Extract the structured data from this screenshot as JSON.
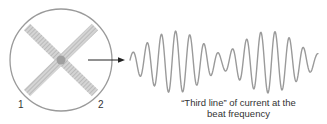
{
  "diagram": {
    "circle": {
      "label_left": "1",
      "label_right": "2",
      "stroke": "#9a9a9a",
      "beam_color": "#b8b8b8"
    },
    "arrow": {
      "color": "#222222"
    },
    "waveform": {
      "stroke": "#9a9a9a",
      "packets": 2
    },
    "caption": {
      "line1": "“Third line” of current at the",
      "line2": "beat frequency"
    }
  }
}
